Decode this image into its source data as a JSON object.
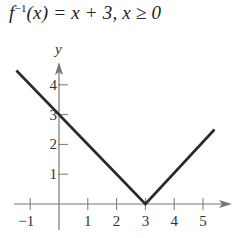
{
  "title": {
    "func": "f",
    "sup": "−1",
    "rest": "(x) = x + 3, x ≥ 0"
  },
  "chart_data": {
    "type": "line",
    "xlabel": "",
    "ylabel": "y",
    "xlim": [
      -1.5,
      6
    ],
    "ylim": [
      -0.5,
      4.9
    ],
    "x_ticks": [
      -1,
      1,
      2,
      3,
      4,
      5
    ],
    "y_ticks": [
      1,
      2,
      3,
      4
    ],
    "grid": false,
    "series": [
      {
        "name": "y = |x - 3|",
        "points": [
          [
            -1.48,
            4.48
          ],
          [
            3,
            0
          ],
          [
            5.4,
            2.5
          ]
        ]
      }
    ]
  },
  "axes": {
    "x_tick_labels": [
      "−1",
      "1",
      "2",
      "3",
      "4",
      "5"
    ],
    "y_tick_labels": [
      "1",
      "2",
      "3",
      "4"
    ],
    "y_label": "y"
  }
}
